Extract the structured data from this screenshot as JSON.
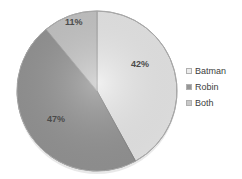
{
  "chart_data": {
    "type": "pie",
    "title": "",
    "subtitle": "",
    "xlabel": "",
    "ylabel": "",
    "grid": false,
    "legend_position": "right",
    "categories": [
      "Batman",
      "Robin",
      "Both"
    ],
    "values": [
      42,
      47,
      11
    ],
    "value_unit": "%",
    "data_labels": [
      "42%",
      "47%",
      "11%"
    ],
    "colors": [
      "#ececec",
      "#969696",
      "#c8c8c8"
    ],
    "start_angle_deg": 0,
    "direction": "clockwise",
    "slices": [
      {
        "label": "Batman",
        "value": 42,
        "data_label": "42%",
        "color": "#ececec"
      },
      {
        "label": "Robin",
        "value": 47,
        "data_label": "47%",
        "color": "#969696"
      },
      {
        "label": "Both",
        "value": 11,
        "data_label": "11%",
        "color": "#c8c8c8"
      }
    ]
  },
  "legend": {
    "items": [
      {
        "label": "Batman",
        "swatch_color": "#ececec",
        "swatch_name": "legend-swatch-batman"
      },
      {
        "label": "Robin",
        "swatch_color": "#969696",
        "swatch_name": "legend-swatch-robin"
      },
      {
        "label": "Both",
        "swatch_color": "#c8c8c8",
        "swatch_name": "legend-swatch-both"
      }
    ]
  },
  "colors": {
    "background": "#ffffff",
    "slice_batman": "#ececec",
    "slice_robin": "#969696",
    "slice_both": "#c8c8c8",
    "outline": "#a8a8a8",
    "label_text": "#4a4a4a",
    "legend_text": "#3d3d3d"
  }
}
